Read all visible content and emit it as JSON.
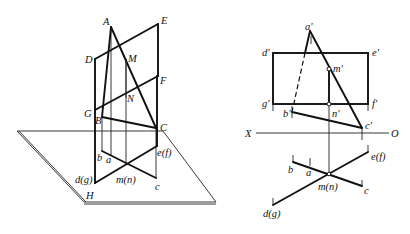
{
  "figure": {
    "colors": {
      "line": "#111111",
      "background": "#ffffff"
    }
  },
  "left_view": {
    "plane_label": "H",
    "points_3d": {
      "A": "A",
      "E": "E",
      "D": "D",
      "M": "M",
      "F": "F",
      "G": "G",
      "N": "N",
      "B": "B",
      "C": "C"
    },
    "projections": {
      "b": "b",
      "a": "a",
      "c": "c",
      "dg": "d(g)",
      "mn": "m(n)",
      "ef": "e(f)"
    }
  },
  "right_view": {
    "axis": {
      "x_label": "X",
      "o_label": "O"
    },
    "front_labels": {
      "a": "a'",
      "d": "d'",
      "e": "e'",
      "m": "m'",
      "g": "g'",
      "f": "f'",
      "b": "b'",
      "n": "n'",
      "c": "c'"
    },
    "top_labels": {
      "ef": "e(f)",
      "b": "b",
      "a": "a",
      "mn": "m(n)",
      "c": "c",
      "dg": "d(g)"
    }
  }
}
